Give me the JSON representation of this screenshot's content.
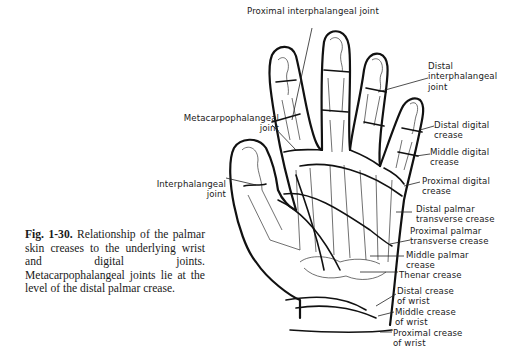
{
  "figure": {
    "caption": {
      "number": "Fig. 1-30.",
      "text": " Relationship of the palmar skin creases to the underlying wrist and digital joints. Metacarpophalangeal joints lie at the level of the distal palmar crease."
    },
    "labels": {
      "proximal_interphalangeal_joint": "Proximal interphalangeal joint",
      "distal_interphalangeal_joint": [
        "Distal",
        "interphalangeal",
        "joint"
      ],
      "metacarpophalangeal_joint": [
        "Metacarpophalangeal",
        "joint"
      ],
      "interphalangeal_joint": [
        "Interphalangeal",
        "joint"
      ],
      "distal_digital_crease": [
        "Distal digital",
        "crease"
      ],
      "middle_digital_crease": [
        "Middle digital",
        "crease"
      ],
      "proximal_digital_crease": [
        "Proximal digital",
        "crease"
      ],
      "distal_palmar_transverse_crease": [
        "Distal palmar",
        "transverse crease"
      ],
      "proximal_palmar_transverse_crease": [
        "Proximal palmar",
        "transverse crease"
      ],
      "middle_palmar_crease": [
        "Middle palmar",
        "crease"
      ],
      "thenar_crease": [
        "Thenar crease"
      ],
      "distal_crease_of_wrist": [
        "Distal crease",
        "of wrist"
      ],
      "middle_crease_of_wrist": [
        "Middle crease",
        "of wrist"
      ],
      "proximal_crease_of_wrist": [
        "Proximal crease",
        "of wrist"
      ]
    }
  }
}
